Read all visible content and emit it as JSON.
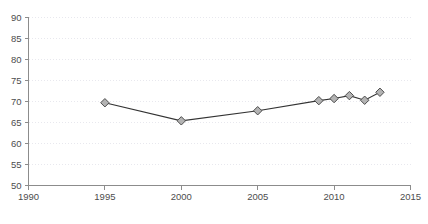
{
  "chart_data": {
    "type": "line",
    "title": "",
    "subtitle": "",
    "xlabel": "",
    "ylabel": "",
    "xlim": [
      1990,
      2015
    ],
    "ylim": [
      50,
      90
    ],
    "grid": true,
    "legend": false,
    "x_ticks": [
      "1990",
      "1995",
      "2000",
      "2005",
      "2010",
      "2015"
    ],
    "x_tick_values": [
      1990,
      1995,
      2000,
      2005,
      2010,
      2015
    ],
    "y_ticks": [
      "50",
      "55",
      "60",
      "65",
      "70",
      "75",
      "80",
      "85",
      "90"
    ],
    "y_tick_values": [
      50,
      55,
      60,
      65,
      70,
      75,
      80,
      85,
      90
    ],
    "marker": "diamond",
    "series": [
      {
        "name": "series-1",
        "color": "#333333",
        "marker_fill": "#b3b3b3",
        "marker_stroke": "#4d4d4d",
        "x": [
          1995,
          2000,
          2005,
          2009,
          2010,
          2011,
          2012,
          2013
        ],
        "values": [
          69.7,
          65.4,
          67.8,
          70.2,
          70.7,
          71.4,
          70.3,
          72.2
        ],
        "points": [
          {
            "x": 1995,
            "y": 69.7
          },
          {
            "x": 2000,
            "y": 65.4
          },
          {
            "x": 2005,
            "y": 67.8
          },
          {
            "x": 2009,
            "y": 70.2
          },
          {
            "x": 2010,
            "y": 70.7
          },
          {
            "x": 2011,
            "y": 71.4
          },
          {
            "x": 2012,
            "y": 70.3
          },
          {
            "x": 2013,
            "y": 72.2
          }
        ]
      }
    ]
  },
  "colors": {
    "background": "#ffffff",
    "axis": "#8c8c8c",
    "grid": "#e8e8ee",
    "line": "#333333",
    "marker_fill": "#b3b3b3",
    "marker_stroke": "#4d4d4d",
    "tick_text": "#4d4d4d"
  }
}
